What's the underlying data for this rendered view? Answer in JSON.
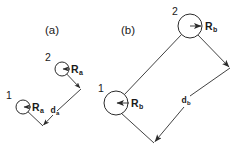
{
  "figure": {
    "background_color": "#ffffff",
    "line_color": "#2b2b2b",
    "text_color": "#1a1a1a",
    "width": 242,
    "height": 153
  },
  "panels": [
    {
      "id": "a",
      "title": "(a)",
      "title_pos": {
        "x": 52,
        "y": 34
      },
      "nodes": [
        {
          "label": "1",
          "label_pos": {
            "x": 9,
            "y": 98
          },
          "circle": {
            "cx": 23,
            "cy": 107,
            "r": 7
          },
          "radius_symbol": "R",
          "radius_subscript": "a",
          "radius_label_pos": {
            "x": 32,
            "y": 111
          },
          "arrow_direction": "left",
          "arrow": {
            "x1": 30,
            "y1": 107,
            "x2": 23,
            "y2": 107
          }
        },
        {
          "label": "2",
          "label_pos": {
            "x": 48,
            "y": 60
          },
          "circle": {
            "cx": 62,
            "cy": 69,
            "r": 7
          },
          "radius_symbol": "R",
          "radius_subscript": "a",
          "radius_label_pos": {
            "x": 71,
            "y": 73
          },
          "arrow_direction": "left",
          "arrow": {
            "x1": 69,
            "y1": 69,
            "x2": 62,
            "y2": 69
          }
        }
      ],
      "vertices": {
        "node1": {
          "x": 23,
          "y": 107
        },
        "node2": {
          "x": 62,
          "y": 69
        },
        "right": {
          "x": 81,
          "y": 89
        },
        "bottom": {
          "x": 43,
          "y": 126
        }
      },
      "distance_symbol": "d",
      "distance_subscript": "a",
      "distance_label_pos": {
        "x": 55,
        "y": 113
      }
    },
    {
      "id": "b",
      "title": "(b)",
      "title_pos": {
        "x": 128,
        "y": 34
      },
      "nodes": [
        {
          "label": "2",
          "label_pos": {
            "x": 175,
            "y": 14
          },
          "circle": {
            "cx": 190,
            "cy": 26,
            "r": 12
          },
          "radius_symbol": "R",
          "radius_subscript": "b",
          "radius_label_pos": {
            "x": 205,
            "y": 30
          },
          "arrow_direction": "right",
          "arrow": {
            "x1": 190,
            "y1": 26,
            "x2": 202,
            "y2": 26
          }
        },
        {
          "label": "1",
          "label_pos": {
            "x": 101,
            "y": 90
          },
          "circle": {
            "cx": 116,
            "cy": 103,
            "r": 12
          },
          "radius_symbol": "R",
          "radius_subscript": "b",
          "radius_label_pos": {
            "x": 131,
            "y": 107
          },
          "arrow_direction": "left",
          "arrow": {
            "x1": 128,
            "y1": 103,
            "x2": 116,
            "y2": 103
          }
        }
      ],
      "vertices": {
        "node1": {
          "x": 116,
          "y": 103
        },
        "node2": {
          "x": 190,
          "y": 26
        },
        "right": {
          "x": 230,
          "y": 68
        },
        "bottom": {
          "x": 154,
          "y": 143
        }
      },
      "distance_symbol": "d",
      "distance_subscript": "b",
      "distance_label_pos": {
        "x": 186,
        "y": 103
      }
    }
  ]
}
